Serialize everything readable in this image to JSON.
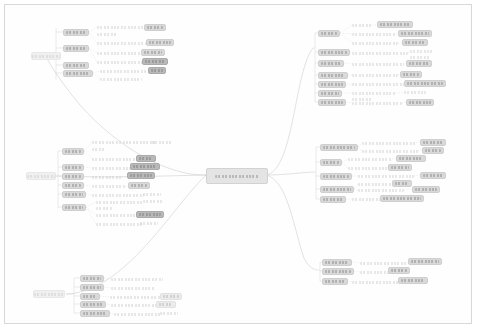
{
  "app": {
    "title": "PC Design Patterns",
    "canvas_background": "#ffffff",
    "frame_border_color": "#d8d8d8",
    "edge_color": "#cfcfcf",
    "node_fill": "#d9d9d9",
    "node_fill_dark": "#b9b9b9",
    "node_fill_pale": "#ececec",
    "text_color": "#9a9a9a",
    "zoom_level": "fit"
  },
  "root": {
    "label": "PC Design Patterns",
    "x": 206,
    "y": 168,
    "w": 60,
    "h": 14
  },
  "anchors": [
    {
      "name": "anchor-left-top",
      "label": "",
      "x": 31,
      "y": 52,
      "w": 30,
      "h": 8
    },
    {
      "name": "anchor-left-middle",
      "label": "",
      "x": 26,
      "y": 172,
      "w": 30,
      "h": 8
    },
    {
      "name": "anchor-left-bottom",
      "label": "",
      "x": 33,
      "y": 290,
      "w": 32,
      "h": 8
    }
  ],
  "clusters": [
    {
      "name": "cluster-left-top",
      "side": "left",
      "branches": [
        {
          "label": "",
          "x": 63,
          "y": 29,
          "w": 26,
          "h": 7,
          "kind": "pill"
        },
        {
          "label": "",
          "x": 63,
          "y": 45,
          "w": 26,
          "h": 7,
          "kind": "pill"
        },
        {
          "label": "",
          "x": 63,
          "y": 62,
          "w": 26,
          "h": 7,
          "kind": "pill"
        },
        {
          "label": "",
          "x": 63,
          "y": 70,
          "w": 30,
          "h": 7,
          "kind": "pill"
        }
      ],
      "leaves": [
        {
          "label": "",
          "x": 97,
          "y": 24,
          "w": 60,
          "h": 6,
          "kind": "txt"
        },
        {
          "label": "",
          "x": 97,
          "y": 31,
          "w": 20,
          "h": 6,
          "kind": "txt"
        },
        {
          "label": "",
          "x": 144,
          "y": 24,
          "w": 22,
          "h": 7,
          "kind": "pill"
        },
        {
          "label": "",
          "x": 97,
          "y": 40,
          "w": 66,
          "h": 6,
          "kind": "txt"
        },
        {
          "label": "",
          "x": 146,
          "y": 39,
          "w": 28,
          "h": 7,
          "kind": "pill"
        },
        {
          "label": "",
          "x": 97,
          "y": 50,
          "w": 54,
          "h": 6,
          "kind": "txt"
        },
        {
          "label": "",
          "x": 141,
          "y": 49,
          "w": 24,
          "h": 7,
          "kind": "pill"
        },
        {
          "label": "",
          "x": 97,
          "y": 59,
          "w": 56,
          "h": 6,
          "kind": "txt"
        },
        {
          "label": "",
          "x": 142,
          "y": 58,
          "w": 26,
          "h": 7,
          "kind": "pill dark"
        },
        {
          "label": "",
          "x": 100,
          "y": 68,
          "w": 48,
          "h": 6,
          "kind": "txt"
        },
        {
          "label": "",
          "x": 148,
          "y": 67,
          "w": 18,
          "h": 7,
          "kind": "pill dark"
        },
        {
          "label": "",
          "x": 100,
          "y": 76,
          "w": 42,
          "h": 6,
          "kind": "txt"
        }
      ]
    },
    {
      "name": "cluster-left-middle",
      "side": "left",
      "branches": [
        {
          "label": "",
          "x": 62,
          "y": 148,
          "w": 22,
          "h": 7,
          "kind": "pill"
        },
        {
          "label": "",
          "x": 62,
          "y": 164,
          "w": 22,
          "h": 7,
          "kind": "pill"
        },
        {
          "label": "",
          "x": 62,
          "y": 173,
          "w": 22,
          "h": 7,
          "kind": "pill"
        },
        {
          "label": "",
          "x": 62,
          "y": 182,
          "w": 22,
          "h": 7,
          "kind": "pill"
        },
        {
          "label": "",
          "x": 62,
          "y": 191,
          "w": 24,
          "h": 7,
          "kind": "pill"
        },
        {
          "label": "",
          "x": 62,
          "y": 204,
          "w": 24,
          "h": 7,
          "kind": "pill"
        }
      ],
      "leaves": [
        {
          "label": "",
          "x": 92,
          "y": 139,
          "w": 64,
          "h": 6,
          "kind": "txt"
        },
        {
          "label": "",
          "x": 92,
          "y": 146,
          "w": 14,
          "h": 6,
          "kind": "txt"
        },
        {
          "label": "",
          "x": 152,
          "y": 139,
          "w": 20,
          "h": 6,
          "kind": "txt"
        },
        {
          "label": "",
          "x": 92,
          "y": 156,
          "w": 56,
          "h": 6,
          "kind": "txt"
        },
        {
          "label": "",
          "x": 136,
          "y": 155,
          "w": 20,
          "h": 7,
          "kind": "pill dark"
        },
        {
          "label": "",
          "x": 92,
          "y": 165,
          "w": 40,
          "h": 6,
          "kind": "txt"
        },
        {
          "label": "",
          "x": 130,
          "y": 163,
          "w": 30,
          "h": 7,
          "kind": "pill dark"
        },
        {
          "label": "",
          "x": 92,
          "y": 174,
          "w": 30,
          "h": 6,
          "kind": "txt"
        },
        {
          "label": "",
          "x": 127,
          "y": 172,
          "w": 28,
          "h": 7,
          "kind": "pill dark"
        },
        {
          "label": "",
          "x": 92,
          "y": 183,
          "w": 34,
          "h": 6,
          "kind": "txt"
        },
        {
          "label": "",
          "x": 128,
          "y": 182,
          "w": 22,
          "h": 7,
          "kind": "pill"
        },
        {
          "label": "",
          "x": 92,
          "y": 192,
          "w": 52,
          "h": 6,
          "kind": "txt"
        },
        {
          "label": "",
          "x": 143,
          "y": 191,
          "w": 18,
          "h": 6,
          "kind": "txt"
        },
        {
          "label": "",
          "x": 96,
          "y": 199,
          "w": 48,
          "h": 6,
          "kind": "txt"
        },
        {
          "label": "",
          "x": 96,
          "y": 205,
          "w": 16,
          "h": 6,
          "kind": "txt"
        },
        {
          "label": "",
          "x": 143,
          "y": 198,
          "w": 20,
          "h": 6,
          "kind": "txt"
        },
        {
          "label": "",
          "x": 96,
          "y": 212,
          "w": 42,
          "h": 6,
          "kind": "txt"
        },
        {
          "label": "",
          "x": 136,
          "y": 211,
          "w": 28,
          "h": 7,
          "kind": "pill dark"
        },
        {
          "label": "",
          "x": 96,
          "y": 221,
          "w": 46,
          "h": 6,
          "kind": "txt"
        },
        {
          "label": "",
          "x": 140,
          "y": 220,
          "w": 18,
          "h": 6,
          "kind": "txt"
        }
      ]
    },
    {
      "name": "cluster-left-bottom",
      "side": "left",
      "branches": [
        {
          "label": "",
          "x": 80,
          "y": 275,
          "w": 24,
          "h": 7,
          "kind": "pill"
        },
        {
          "label": "",
          "x": 80,
          "y": 284,
          "w": 24,
          "h": 7,
          "kind": "pill"
        },
        {
          "label": "",
          "x": 80,
          "y": 293,
          "w": 20,
          "h": 7,
          "kind": "pill"
        },
        {
          "label": "",
          "x": 80,
          "y": 301,
          "w": 26,
          "h": 7,
          "kind": "pill"
        },
        {
          "label": "",
          "x": 80,
          "y": 310,
          "w": 30,
          "h": 7,
          "kind": "pill"
        }
      ],
      "leaves": [
        {
          "label": "",
          "x": 111,
          "y": 276,
          "w": 52,
          "h": 6,
          "kind": "txt"
        },
        {
          "label": "",
          "x": 111,
          "y": 285,
          "w": 44,
          "h": 6,
          "kind": "txt"
        },
        {
          "label": "",
          "x": 110,
          "y": 294,
          "w": 56,
          "h": 6,
          "kind": "txt"
        },
        {
          "label": "",
          "x": 160,
          "y": 293,
          "w": 22,
          "h": 7,
          "kind": "pill pale"
        },
        {
          "label": "",
          "x": 111,
          "y": 302,
          "w": 48,
          "h": 6,
          "kind": "txt"
        },
        {
          "label": "",
          "x": 156,
          "y": 301,
          "w": 20,
          "h": 7,
          "kind": "pill pale"
        },
        {
          "label": "",
          "x": 114,
          "y": 311,
          "w": 48,
          "h": 6,
          "kind": "txt"
        },
        {
          "label": "",
          "x": 160,
          "y": 310,
          "w": 18,
          "h": 6,
          "kind": "txt"
        }
      ]
    },
    {
      "name": "cluster-right-top",
      "side": "right",
      "branches": [
        {
          "label": "",
          "x": 318,
          "y": 30,
          "w": 22,
          "h": 7,
          "kind": "pill"
        },
        {
          "label": "",
          "x": 318,
          "y": 49,
          "w": 32,
          "h": 7,
          "kind": "pill"
        },
        {
          "label": "",
          "x": 318,
          "y": 60,
          "w": 26,
          "h": 7,
          "kind": "pill"
        },
        {
          "label": "",
          "x": 318,
          "y": 72,
          "w": 30,
          "h": 7,
          "kind": "pill"
        },
        {
          "label": "",
          "x": 318,
          "y": 81,
          "w": 28,
          "h": 7,
          "kind": "pill"
        },
        {
          "label": "",
          "x": 318,
          "y": 90,
          "w": 24,
          "h": 7,
          "kind": "pill"
        },
        {
          "label": "",
          "x": 318,
          "y": 99,
          "w": 28,
          "h": 7,
          "kind": "pill"
        }
      ],
      "leaves": [
        {
          "label": "",
          "x": 352,
          "y": 22,
          "w": 20,
          "h": 6,
          "kind": "txt"
        },
        {
          "label": "",
          "x": 377,
          "y": 21,
          "w": 36,
          "h": 7,
          "kind": "pill"
        },
        {
          "label": "",
          "x": 352,
          "y": 31,
          "w": 44,
          "h": 6,
          "kind": "txt"
        },
        {
          "label": "",
          "x": 398,
          "y": 30,
          "w": 34,
          "h": 7,
          "kind": "pill"
        },
        {
          "label": "",
          "x": 352,
          "y": 40,
          "w": 46,
          "h": 6,
          "kind": "txt"
        },
        {
          "label": "",
          "x": 402,
          "y": 39,
          "w": 26,
          "h": 7,
          "kind": "pill"
        },
        {
          "label": "",
          "x": 352,
          "y": 50,
          "w": 56,
          "h": 6,
          "kind": "txt"
        },
        {
          "label": "",
          "x": 410,
          "y": 48,
          "w": 24,
          "h": 6,
          "kind": "txt"
        },
        {
          "label": "",
          "x": 410,
          "y": 54,
          "w": 20,
          "h": 6,
          "kind": "txt"
        },
        {
          "label": "",
          "x": 352,
          "y": 61,
          "w": 52,
          "h": 6,
          "kind": "txt"
        },
        {
          "label": "",
          "x": 406,
          "y": 60,
          "w": 26,
          "h": 7,
          "kind": "pill"
        },
        {
          "label": "",
          "x": 352,
          "y": 72,
          "w": 46,
          "h": 6,
          "kind": "txt"
        },
        {
          "label": "",
          "x": 400,
          "y": 71,
          "w": 22,
          "h": 7,
          "kind": "pill"
        },
        {
          "label": "",
          "x": 352,
          "y": 81,
          "w": 56,
          "h": 6,
          "kind": "txt"
        },
        {
          "label": "",
          "x": 404,
          "y": 80,
          "w": 42,
          "h": 7,
          "kind": "pill"
        },
        {
          "label": "",
          "x": 352,
          "y": 90,
          "w": 44,
          "h": 6,
          "kind": "txt"
        },
        {
          "label": "",
          "x": 352,
          "y": 96,
          "w": 20,
          "h": 6,
          "kind": "txt"
        },
        {
          "label": "",
          "x": 404,
          "y": 89,
          "w": 22,
          "h": 6,
          "kind": "txt"
        },
        {
          "label": "",
          "x": 352,
          "y": 100,
          "w": 50,
          "h": 6,
          "kind": "txt"
        },
        {
          "label": "",
          "x": 406,
          "y": 99,
          "w": 28,
          "h": 7,
          "kind": "pill"
        }
      ]
    },
    {
      "name": "cluster-right-middle",
      "side": "right",
      "branches": [
        {
          "label": "",
          "x": 320,
          "y": 144,
          "w": 38,
          "h": 7,
          "kind": "pill"
        },
        {
          "label": "",
          "x": 320,
          "y": 159,
          "w": 22,
          "h": 7,
          "kind": "pill"
        },
        {
          "label": "",
          "x": 320,
          "y": 173,
          "w": 32,
          "h": 7,
          "kind": "pill"
        },
        {
          "label": "",
          "x": 320,
          "y": 186,
          "w": 34,
          "h": 7,
          "kind": "pill"
        },
        {
          "label": "",
          "x": 320,
          "y": 196,
          "w": 26,
          "h": 7,
          "kind": "pill"
        }
      ],
      "leaves": [
        {
          "label": "",
          "x": 362,
          "y": 140,
          "w": 54,
          "h": 6,
          "kind": "txt"
        },
        {
          "label": "",
          "x": 420,
          "y": 139,
          "w": 26,
          "h": 7,
          "kind": "pill"
        },
        {
          "label": "",
          "x": 362,
          "y": 148,
          "w": 56,
          "h": 6,
          "kind": "txt"
        },
        {
          "label": "",
          "x": 422,
          "y": 147,
          "w": 22,
          "h": 7,
          "kind": "pill"
        },
        {
          "label": "",
          "x": 348,
          "y": 156,
          "w": 44,
          "h": 6,
          "kind": "txt"
        },
        {
          "label": "",
          "x": 396,
          "y": 155,
          "w": 30,
          "h": 7,
          "kind": "pill"
        },
        {
          "label": "",
          "x": 348,
          "y": 165,
          "w": 40,
          "h": 6,
          "kind": "txt"
        },
        {
          "label": "",
          "x": 388,
          "y": 164,
          "w": 24,
          "h": 7,
          "kind": "pill"
        },
        {
          "label": "",
          "x": 358,
          "y": 173,
          "w": 56,
          "h": 6,
          "kind": "txt"
        },
        {
          "label": "",
          "x": 420,
          "y": 172,
          "w": 26,
          "h": 7,
          "kind": "pill"
        },
        {
          "label": "",
          "x": 358,
          "y": 181,
          "w": 34,
          "h": 6,
          "kind": "txt"
        },
        {
          "label": "",
          "x": 392,
          "y": 180,
          "w": 20,
          "h": 7,
          "kind": "pill"
        },
        {
          "label": "",
          "x": 358,
          "y": 187,
          "w": 46,
          "h": 6,
          "kind": "txt"
        },
        {
          "label": "",
          "x": 412,
          "y": 186,
          "w": 28,
          "h": 7,
          "kind": "pill"
        },
        {
          "label": "",
          "x": 352,
          "y": 196,
          "w": 30,
          "h": 6,
          "kind": "txt"
        },
        {
          "label": "",
          "x": 380,
          "y": 195,
          "w": 44,
          "h": 7,
          "kind": "pill"
        }
      ]
    },
    {
      "name": "cluster-right-bottom",
      "side": "right",
      "branches": [
        {
          "label": "",
          "x": 322,
          "y": 259,
          "w": 30,
          "h": 7,
          "kind": "pill"
        },
        {
          "label": "",
          "x": 322,
          "y": 268,
          "w": 32,
          "h": 7,
          "kind": "pill"
        },
        {
          "label": "",
          "x": 322,
          "y": 278,
          "w": 26,
          "h": 7,
          "kind": "pill"
        }
      ],
      "leaves": [
        {
          "label": "",
          "x": 360,
          "y": 260,
          "w": 48,
          "h": 6,
          "kind": "txt"
        },
        {
          "label": "",
          "x": 408,
          "y": 258,
          "w": 34,
          "h": 7,
          "kind": "pill"
        },
        {
          "label": "",
          "x": 360,
          "y": 269,
          "w": 30,
          "h": 6,
          "kind": "txt"
        },
        {
          "label": "",
          "x": 388,
          "y": 267,
          "w": 22,
          "h": 7,
          "kind": "pill"
        },
        {
          "label": "",
          "x": 352,
          "y": 279,
          "w": 48,
          "h": 6,
          "kind": "txt"
        },
        {
          "label": "",
          "x": 398,
          "y": 277,
          "w": 30,
          "h": 7,
          "kind": "pill"
        }
      ]
    }
  ]
}
